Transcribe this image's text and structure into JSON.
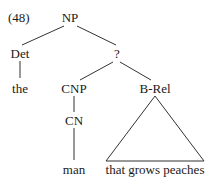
{
  "example_number": "(48)",
  "tree": {
    "root": {
      "label": "NP",
      "x": 70,
      "y": 11
    },
    "nodes": [
      {
        "id": "det",
        "label": "Det",
        "x": 20,
        "y": 47
      },
      {
        "id": "q",
        "label": "?",
        "x": 117,
        "y": 47
      },
      {
        "id": "the",
        "label": "the",
        "x": 20,
        "y": 82
      },
      {
        "id": "cnp",
        "label": "CNP",
        "x": 74,
        "y": 82
      },
      {
        "id": "brel",
        "label": "B-Rel",
        "x": 155,
        "y": 82
      },
      {
        "id": "cn",
        "label": "CN",
        "x": 74,
        "y": 115
      },
      {
        "id": "man",
        "label": "man",
        "x": 74,
        "y": 163
      },
      {
        "id": "phrase",
        "label": "that grows peaches",
        "x": 155,
        "y": 163
      }
    ],
    "edges": [
      {
        "from": "NP",
        "to": "Det"
      },
      {
        "from": "NP",
        "to": "?"
      },
      {
        "from": "Det",
        "to": "the"
      },
      {
        "from": "?",
        "to": "CNP"
      },
      {
        "from": "?",
        "to": "B-Rel"
      },
      {
        "from": "CNP",
        "to": "CN"
      },
      {
        "from": "CN",
        "to": "man"
      },
      {
        "from": "B-Rel",
        "to": "that grows peaches",
        "style": "triangle"
      }
    ]
  },
  "labels": {
    "np": "NP",
    "det": "Det",
    "q": "?",
    "the": "the",
    "cnp": "CNP",
    "brel": "B-Rel",
    "cn": "CN",
    "man": "man",
    "phrase": "that grows peaches"
  }
}
